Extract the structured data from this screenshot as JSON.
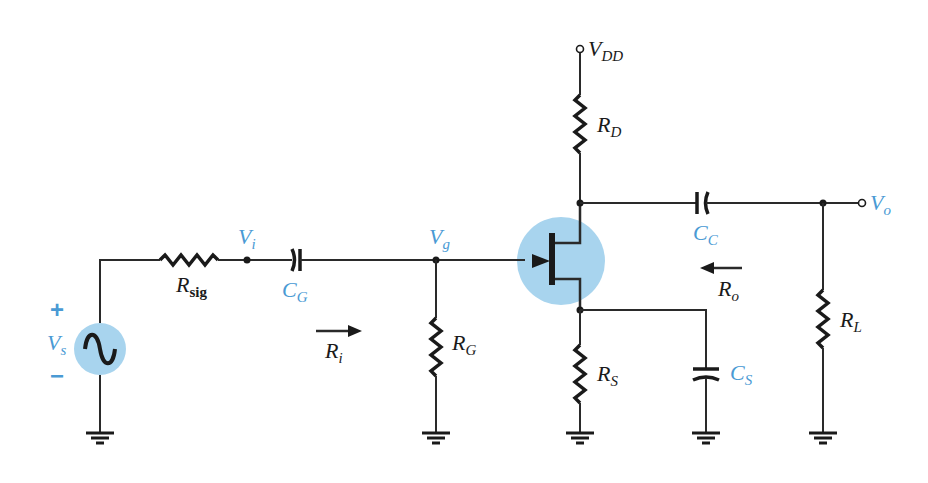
{
  "diagram": {
    "type": "circuit-schematic",
    "colors": {
      "wire": "#2a2a2a",
      "highlight": "#a8d4ee",
      "blue_label": "#4a9ad4"
    },
    "labels": {
      "vdd": {
        "main": "V",
        "sub": "DD"
      },
      "rd": {
        "main": "R",
        "sub": "D"
      },
      "rsig": {
        "main": "R",
        "sub": "sig"
      },
      "vi": {
        "main": "V",
        "sub": "i"
      },
      "cg": {
        "main": "C",
        "sub": "G"
      },
      "vg": {
        "main": "V",
        "sub": "g"
      },
      "ri": {
        "main": "R",
        "sub": "i"
      },
      "rg": {
        "main": "R",
        "sub": "G"
      },
      "cc": {
        "main": "C",
        "sub": "C"
      },
      "vo": {
        "main": "V",
        "sub": "o"
      },
      "ro": {
        "main": "R",
        "sub": "o"
      },
      "rs": {
        "main": "R",
        "sub": "S"
      },
      "cs": {
        "main": "C",
        "sub": "S"
      },
      "rl": {
        "main": "R",
        "sub": "L"
      },
      "vs": {
        "main": "V",
        "sub": "s"
      },
      "plus": "+",
      "minus": "−"
    },
    "components": [
      {
        "id": "Vs",
        "kind": "ac-source"
      },
      {
        "id": "Rsig",
        "kind": "resistor"
      },
      {
        "id": "CG",
        "kind": "capacitor"
      },
      {
        "id": "RG",
        "kind": "resistor"
      },
      {
        "id": "JFET",
        "kind": "n-channel-jfet"
      },
      {
        "id": "RD",
        "kind": "resistor"
      },
      {
        "id": "RS",
        "kind": "resistor"
      },
      {
        "id": "CS",
        "kind": "capacitor"
      },
      {
        "id": "CC",
        "kind": "capacitor"
      },
      {
        "id": "RL",
        "kind": "resistor"
      }
    ],
    "nodes": [
      "Vi",
      "Vg",
      "Vo",
      "VDD",
      "ground"
    ],
    "arrows": [
      {
        "label": "Ri",
        "direction": "right"
      },
      {
        "label": "Ro",
        "direction": "left"
      }
    ]
  }
}
